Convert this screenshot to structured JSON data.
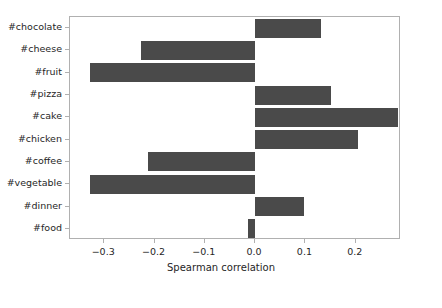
{
  "chart_data": {
    "type": "bar",
    "orientation": "horizontal",
    "title": "",
    "xlabel": "Spearman correlation",
    "ylabel": "",
    "categories": [
      "#chocolate",
      "#cheese",
      "#fruit",
      "#pizza",
      "#cake",
      "#chicken",
      "#coffee",
      "#vegetable",
      "#dinner",
      "#food"
    ],
    "values": [
      0.131,
      -0.227,
      -0.329,
      0.151,
      0.284,
      0.204,
      -0.213,
      -0.329,
      0.098,
      -0.014
    ],
    "xlim": [
      -0.368,
      0.29
    ],
    "ylim_categories_top_to_bottom": true,
    "xticks": [
      -0.3,
      -0.2,
      -0.1,
      0.0,
      0.1,
      0.2,
      0.3
    ],
    "xticklabels": [
      "−0.3",
      "−0.2",
      "−0.1",
      "0.0",
      "0.1",
      "0.2",
      "0.3"
    ],
    "grid": false,
    "legend": null,
    "bar_color": "#4a4a4a",
    "background_color": "#ffffff",
    "axes_color": "#b0b0b0"
  }
}
